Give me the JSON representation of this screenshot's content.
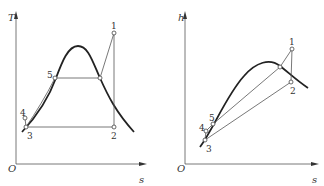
{
  "diagrams": [
    {
      "name": "T-s diagram",
      "y_axis_label": "T",
      "x_axis_label": "s",
      "origin_label": "O",
      "points": [
        {
          "label": "1",
          "x": 114,
          "y": 33
        },
        {
          "label": "2",
          "x": 114,
          "y": 127
        },
        {
          "label": "3",
          "x": 26,
          "y": 127
        },
        {
          "label": "4",
          "x": 25,
          "y": 118
        },
        {
          "label": "5",
          "x": 55,
          "y": 78
        }
      ]
    },
    {
      "name": "h-s diagram",
      "y_axis_label": "h",
      "x_axis_label": "s",
      "origin_label": "O",
      "points": [
        {
          "label": "1",
          "x": 292,
          "y": 49
        },
        {
          "label": "2",
          "x": 291,
          "y": 82
        },
        {
          "label": "3",
          "x": 205,
          "y": 140
        },
        {
          "label": "4",
          "x": 206,
          "y": 131
        },
        {
          "label": "5",
          "x": 213,
          "y": 124
        }
      ]
    }
  ]
}
